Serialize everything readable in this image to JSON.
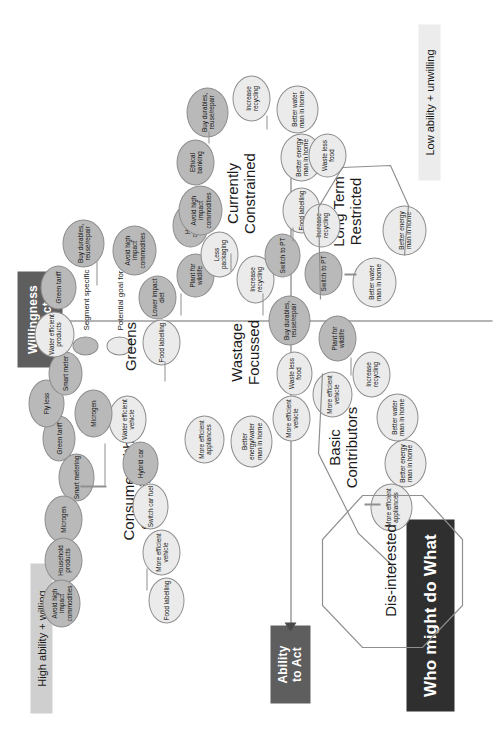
{
  "title": "Who might do What",
  "axes": {
    "x_label": "Ability\nto Act",
    "y_label": "Willingness\nto Act",
    "high_band": "High ability + willing",
    "low_band": "Low ability + unwilling"
  },
  "legend": {
    "segment_specific": "Segment specific",
    "potential_goal": "Potential goal for all"
  },
  "colors": {
    "title_bg": "#2f2f2f",
    "axis_bg": "#5e5e5e",
    "segment_specific": "#b9b9b9",
    "potential_goal": "#ebebeb",
    "band_high": "#cfcfcf",
    "band_low": "#ececec",
    "stroke": "#8d8d8d"
  },
  "segments": [
    {
      "id": "consumer-with-conscience",
      "name": "Consumer with\nConscience",
      "nodes": [
        {
          "label": "Green\ntariff",
          "type": "seg"
        },
        {
          "label": "Household\nproducts",
          "type": "seg"
        },
        {
          "label": "Microgen",
          "type": "seg"
        },
        {
          "label": "Smart\nmetering",
          "type": "seg"
        },
        {
          "label": "Fly less",
          "type": "seg"
        },
        {
          "label": "Water\nefficient\nvehicle",
          "type": "goal"
        },
        {
          "label": "Hybrid\ncar",
          "type": "seg"
        },
        {
          "label": "Switch\ncar fuel",
          "type": "goal"
        },
        {
          "label": "More\nefficient\nvehicle",
          "type": "goal"
        },
        {
          "label": "Food\nlabelling",
          "type": "goal"
        },
        {
          "label": "Avoid high\nimpact\ncommodities",
          "type": "seg"
        }
      ]
    },
    {
      "id": "greens",
      "name": "Greens",
      "nodes": [
        {
          "label": "Smart\nmeter",
          "type": "seg"
        },
        {
          "label": "Water\nefficient\nproducts",
          "type": "goal"
        },
        {
          "label": "Green\ntariff",
          "type": "seg"
        },
        {
          "label": "Buy\ndurables,\nreuse/repair",
          "type": "seg"
        },
        {
          "label": "Avoid high\nimpact\ncommodities",
          "type": "seg"
        },
        {
          "label": "Lower\nimpact\ndiet",
          "type": "seg"
        },
        {
          "label": "Food\nlabelling",
          "type": "goal"
        },
        {
          "label": "Plant for\nwildlife",
          "type": "seg"
        },
        {
          "label": "Home\ncompost",
          "type": "seg"
        },
        {
          "label": "Microgen",
          "type": "seg"
        }
      ]
    },
    {
      "id": "wastage-focussed",
      "name": "Wastage\nFocussed",
      "nodes": [
        {
          "label": "More\nefficient\nappliances",
          "type": "goal"
        },
        {
          "label": "Better\nenergy/water\nman in home",
          "type": "goal"
        },
        {
          "label": "More\nefficient\nvehicle",
          "type": "goal"
        },
        {
          "label": "Waste\nless food",
          "type": "goal"
        },
        {
          "label": "Buy\ndurables,\nreuse/repair",
          "type": "seg"
        },
        {
          "label": "Increase\nrecycling",
          "type": "goal"
        },
        {
          "label": "Less\npackaging",
          "type": "goal"
        },
        {
          "label": "Home\ncompost",
          "type": "seg"
        }
      ]
    },
    {
      "id": "currently-constrained",
      "name": "Currently\nConstrained",
      "nodes": [
        {
          "label": "Avoid high\nimpact\ncommodities",
          "type": "seg"
        },
        {
          "label": "Ethical\nbanking",
          "type": "seg"
        },
        {
          "label": "Buy\ndurables,\nreuse/repair",
          "type": "seg"
        },
        {
          "label": "Increase\nrecycling",
          "type": "goal"
        },
        {
          "label": "Better water\nman in\nhome",
          "type": "goal"
        },
        {
          "label": "Better\nenergy man\nin home",
          "type": "goal"
        },
        {
          "label": "Food\nlabelling",
          "type": "goal"
        },
        {
          "label": "Switch to\nPT",
          "type": "seg"
        }
      ]
    },
    {
      "id": "basic-contributors",
      "name": "Basic\nContributors",
      "nodes": [
        {
          "label": "More\nefficient\nvehicle",
          "type": "goal"
        },
        {
          "label": "More\nefficient\nappliances",
          "type": "goal"
        },
        {
          "label": "Better\nenergy man\nin home",
          "type": "goal"
        },
        {
          "label": "Better water\nman in\nhome",
          "type": "goal"
        },
        {
          "label": "Increase\nrecycling",
          "type": "goal"
        },
        {
          "label": "Plant for\nwildlife",
          "type": "seg"
        }
      ]
    },
    {
      "id": "long-term-restricted",
      "name": "Long Term\nRestricted",
      "nodes": [
        {
          "label": "Switch to\nPT",
          "type": "seg"
        },
        {
          "label": "Increase\nrecycling",
          "type": "goal"
        },
        {
          "label": "Waste\nless food",
          "type": "goal"
        },
        {
          "label": "Better water\nman in home",
          "type": "goal"
        },
        {
          "label": "Better\nenergy man\nin home",
          "type": "goal"
        }
      ]
    },
    {
      "id": "dis-interested",
      "name": "Dis-interested",
      "nodes": []
    }
  ]
}
